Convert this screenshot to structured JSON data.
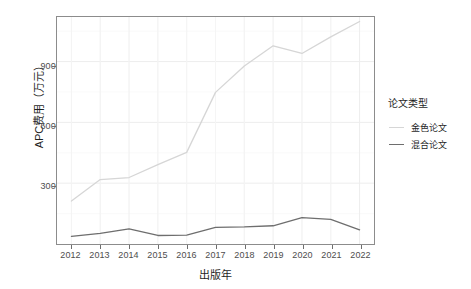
{
  "chart_data": {
    "type": "line",
    "title": "",
    "xlabel": "出版年",
    "ylabel": "APC费用（万元）",
    "x": [
      2012,
      2013,
      2014,
      2015,
      2016,
      2017,
      2018,
      2019,
      2020,
      2021,
      2022
    ],
    "xtick_labels": [
      "2012",
      "2013",
      "2014",
      "2015",
      "2016",
      "2017",
      "2018",
      "2019",
      "2020",
      "2021",
      "2022"
    ],
    "ytick_labels": [
      "300",
      "600",
      "900"
    ],
    "ytick_values": [
      300,
      600,
      900
    ],
    "xlim": [
      2011.5,
      2022.5
    ],
    "ylim": [
      0,
      1120
    ],
    "grid": true,
    "legend_position": "right",
    "series": [
      {
        "name": "金色论文",
        "color": "#d6d6d6",
        "values": [
          212,
          318,
          328,
          392,
          452,
          748,
          878,
          978,
          940,
          1022,
          1098
        ]
      },
      {
        "name": "混合论文",
        "color": "#6e6e6e",
        "values": [
          38,
          52,
          75,
          42,
          44,
          82,
          84,
          90,
          130,
          122,
          70
        ]
      }
    ]
  },
  "legend": {
    "title": "论文类型",
    "items": [
      {
        "label": "金色论文",
        "color": "#d6d6d6"
      },
      {
        "label": "混合论文",
        "color": "#6e6e6e"
      }
    ]
  },
  "axes": {
    "y_title": "APC费用（万元）",
    "x_title": "出版年"
  }
}
